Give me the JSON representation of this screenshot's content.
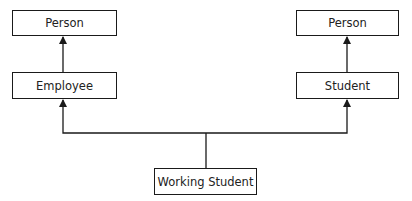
{
  "diagram": {
    "type": "class-inheritance",
    "nodes": [
      {
        "id": "person_left",
        "label": "Person"
      },
      {
        "id": "employee",
        "label": "Employee"
      },
      {
        "id": "person_right",
        "label": "Person"
      },
      {
        "id": "student",
        "label": "Student"
      },
      {
        "id": "working_student",
        "label": "Working Student"
      }
    ],
    "edges": [
      {
        "from": "employee",
        "to": "person_left",
        "arrow": "filled"
      },
      {
        "from": "student",
        "to": "person_right",
        "arrow": "filled"
      },
      {
        "from": "working_student",
        "to": "employee",
        "arrow": "filled"
      },
      {
        "from": "working_student",
        "to": "student",
        "arrow": "filled"
      }
    ],
    "colors": {
      "line": "#1a1a1a",
      "background": "#ffffff"
    }
  }
}
